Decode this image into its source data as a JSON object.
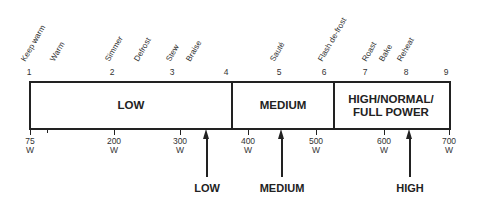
{
  "diagram": {
    "settings": [
      {
        "number": "1",
        "x": 29
      },
      {
        "number": "2",
        "x": 112
      },
      {
        "number": "3",
        "x": 172
      },
      {
        "number": "4",
        "x": 226
      },
      {
        "number": "5",
        "x": 279
      },
      {
        "number": "6",
        "x": 324
      },
      {
        "number": "7",
        "x": 365
      },
      {
        "number": "8",
        "x": 406
      },
      {
        "number": "9",
        "x": 446
      }
    ],
    "functions": [
      {
        "label": "Keep warm",
        "x": 29
      },
      {
        "label": "Warm",
        "x": 58
      },
      {
        "label": "Simmer",
        "x": 113
      },
      {
        "label": "Defrost",
        "x": 142
      },
      {
        "label": "Stew",
        "x": 174
      },
      {
        "label": "Braise",
        "x": 194
      },
      {
        "label": "Sauté",
        "x": 278
      },
      {
        "label": "Flash de-frost",
        "x": 326
      },
      {
        "label": "Roast",
        "x": 370
      },
      {
        "label": "Bake",
        "x": 387
      },
      {
        "label": "Reheat",
        "x": 405
      }
    ],
    "zones": [
      {
        "label": "LOW",
        "left": 31,
        "width": 200
      },
      {
        "label": "MEDIUM",
        "left": 233,
        "width": 100
      },
      {
        "label": "HIGH/NORMAL/\nFULL POWER",
        "left": 335,
        "width": 112
      }
    ],
    "wattages": [
      {
        "value": "75",
        "unit": "W",
        "x": 30
      },
      {
        "value": "200",
        "unit": "W",
        "x": 114
      },
      {
        "value": "300",
        "unit": "W",
        "x": 180
      },
      {
        "value": "400",
        "unit": "W",
        "x": 248
      },
      {
        "value": "500",
        "unit": "W",
        "x": 316
      },
      {
        "value": "600",
        "unit": "W",
        "x": 384
      },
      {
        "value": "700",
        "unit": "W",
        "x": 449
      }
    ],
    "minor_ticks": [
      {
        "x": 47
      }
    ],
    "indicators": [
      {
        "label": "LOW",
        "x": 206
      },
      {
        "label": "MEDIUM",
        "x": 281
      },
      {
        "label": "HIGH",
        "x": 409
      }
    ]
  }
}
